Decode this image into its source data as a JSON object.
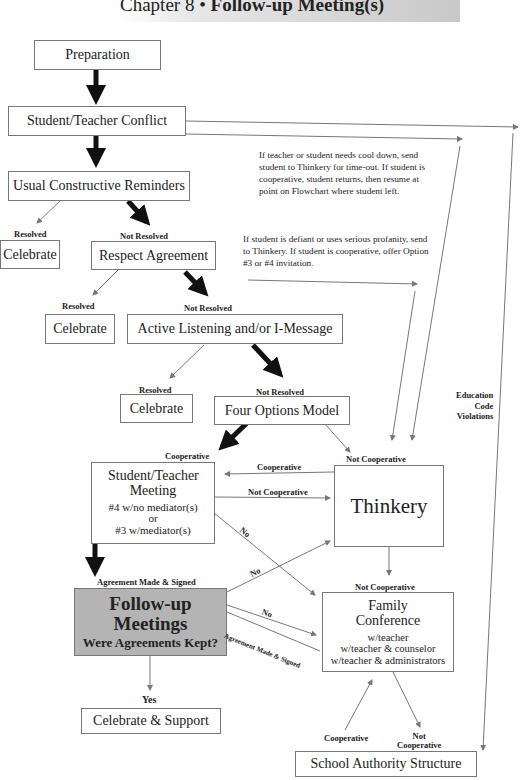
{
  "header": {
    "chapter": "Chapter 8",
    "bullet": "•",
    "title": "Follow-up Meeting(s)"
  },
  "nodes": {
    "preparation": "Preparation",
    "conflict": "Student/Teacher Conflict",
    "reminders": "Usual Constructive Reminders",
    "celebrate1": "Celebrate",
    "respect": "Respect Agreement",
    "celebrate2": "Celebrate",
    "active": "Active Listening and/or I-Message",
    "celebrate3": "Celebrate",
    "four_options": "Four Options Model",
    "meeting_title": "Student/Teacher Meeting",
    "meeting_l1": "#4 w/no mediator(s)",
    "meeting_l2": "or",
    "meeting_l3": "#3 w/mediator(s)",
    "thinkery": "Thinkery",
    "followup_title": "Follow-up Meetings",
    "followup_q": "Were Agreements Kept?",
    "family_title": "Family Conference",
    "family_l1": "w/teacher",
    "family_l2": "w/teacher & counselor",
    "family_l3": "w/teacher & administrators",
    "celebrate_support": "Celebrate & Support",
    "school_authority": "School Authority Structure"
  },
  "labels": {
    "resolved": "Resolved",
    "not_resolved": "Not Resolved",
    "cooperative": "Cooperative",
    "not_cooperative": "Not Cooperative",
    "no": "No",
    "yes": "Yes",
    "agreement": "Agreement Made & Signed",
    "not": "Not",
    "cooperative2": "Cooperative",
    "edu1": "Education",
    "edu2": "Code",
    "edu3": "Violations"
  },
  "notes": {
    "cooldown": "If teacher or student needs cool down, send student to Thinkery for time-out. If student is cooperative, student returns, then resume at point on Flowchart where student left.",
    "defiant": "If student is defiant or uses serious profanity, send to Thinkery. If student is cooperative, offer Option #3 or #4 invitation."
  },
  "colors": {
    "followup_fill": "#b4b4b4",
    "arrow_thick": "#111111",
    "arrow_thin": "#777777"
  }
}
